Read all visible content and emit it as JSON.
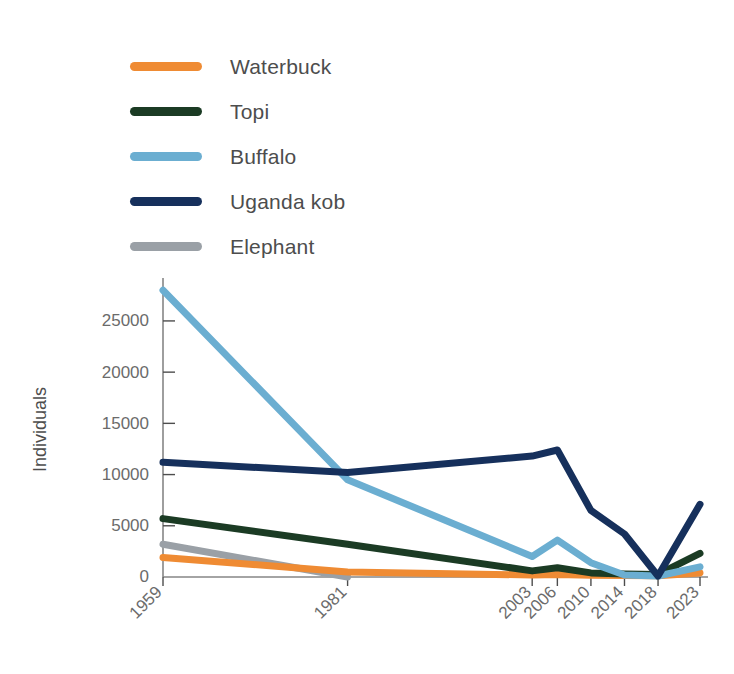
{
  "chart_data": {
    "type": "line",
    "title": "",
    "xlabel": "",
    "ylabel": "Individuals",
    "x": [
      1959,
      1981,
      2003,
      2006,
      2010,
      2014,
      2018,
      2023
    ],
    "xtick_labels": [
      "1959",
      "1981",
      "2003",
      "2006",
      "2010",
      "2014",
      "2018",
      "2023"
    ],
    "ytick_labels": [
      "0",
      "5000",
      "10000",
      "15000",
      "20000",
      "25000"
    ],
    "ytick_values": [
      0,
      5000,
      10000,
      15000,
      20000,
      25000
    ],
    "ylim": [
      0,
      28800
    ],
    "xlim": [
      1959,
      2023
    ],
    "grid": false,
    "legend_position": "above-plot",
    "series": [
      {
        "name": "Waterbuck",
        "color": "#EF8B33",
        "x": [
          1959,
          1981,
          2003,
          2006,
          2010,
          2014,
          2018,
          2023
        ],
        "values": [
          1900,
          500,
          200,
          250,
          180,
          150,
          120,
          400
        ]
      },
      {
        "name": "Topi",
        "color": "#1B3B24",
        "x": [
          1959,
          1981,
          2003,
          2006,
          2010,
          2014,
          2018,
          2023
        ],
        "values": [
          5700,
          3200,
          600,
          900,
          400,
          300,
          250,
          2300
        ]
      },
      {
        "name": "Buffalo",
        "color": "#6BAED1",
        "x": [
          1959,
          1981,
          2003,
          2006,
          2010,
          2014,
          2018,
          2023
        ],
        "values": [
          28000,
          9500,
          2000,
          3600,
          1400,
          200,
          100,
          1000
        ]
      },
      {
        "name": "Uganda kob",
        "color": "#16305C",
        "x": [
          1959,
          1981,
          2003,
          2006,
          2010,
          2014,
          2018,
          2023
        ],
        "values": [
          11200,
          10200,
          11800,
          12400,
          6500,
          4200,
          100,
          7100
        ]
      },
      {
        "name": "Elephant",
        "color": "#9AA0A6",
        "x": [
          1959,
          1981
        ],
        "values": [
          3200,
          0
        ]
      }
    ]
  },
  "legend": {
    "items": [
      {
        "label": "Waterbuck",
        "color": "#EF8B33"
      },
      {
        "label": "Topi",
        "color": "#1B3B24"
      },
      {
        "label": "Buffalo",
        "color": "#6BAED1"
      },
      {
        "label": "Uganda kob",
        "color": "#16305C"
      },
      {
        "label": "Elephant",
        "color": "#9AA0A6"
      }
    ]
  },
  "axes": {
    "y_title": "Individuals"
  }
}
